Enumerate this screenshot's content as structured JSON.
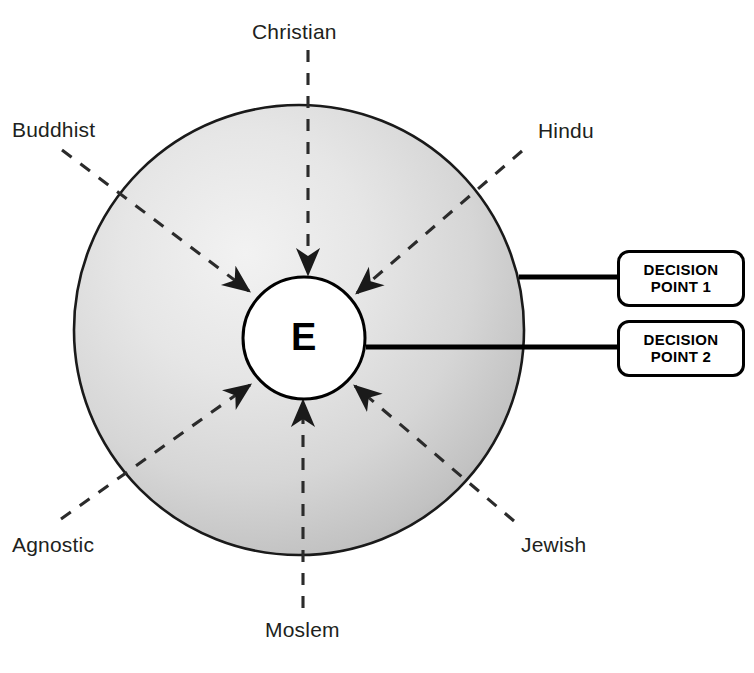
{
  "diagram": {
    "center": {
      "letter": "E",
      "shape": "circle"
    },
    "spokes": [
      {
        "id": "christian",
        "label": "Christian",
        "direction": "top",
        "label_x": 252,
        "label_y": 20,
        "line": {
          "x1": 308,
          "y1": 50,
          "x2": 308,
          "y2": 272
        },
        "arrow_angle": 90
      },
      {
        "id": "hindu",
        "label": "Hindu",
        "direction": "top-right",
        "label_x": 538,
        "label_y": 119,
        "line": {
          "x1": 520,
          "y1": 152,
          "x2": 354,
          "y2": 292
        },
        "arrow_angle": 140
      },
      {
        "id": "jewish",
        "label": "Jewish",
        "direction": "bottom-right",
        "label_x": 521,
        "label_y": 533,
        "line": {
          "x1": 513,
          "y1": 520,
          "x2": 352,
          "y2": 385
        },
        "arrow_angle": 220
      },
      {
        "id": "moslem",
        "label": "Moslem",
        "direction": "bottom",
        "label_x": 265,
        "label_y": 618,
        "line": {
          "x1": 303,
          "y1": 608,
          "x2": 303,
          "y2": 404
        },
        "arrow_angle": 270
      },
      {
        "id": "agnostic",
        "label": "Agnostic",
        "direction": "bottom-left",
        "label_x": 12,
        "label_y": 533,
        "line": {
          "x1": 62,
          "y1": 518,
          "x2": 252,
          "y2": 384
        },
        "arrow_angle": 325
      },
      {
        "id": "buddhist",
        "label": "Buddhist",
        "direction": "top-left",
        "label_x": 12,
        "label_y": 118,
        "line": {
          "x1": 62,
          "y1": 150,
          "x2": 250,
          "y2": 290
        },
        "arrow_angle": 40
      }
    ],
    "decision_points": [
      {
        "id": "decision-point-1",
        "line_1": "DECISION",
        "line_2": "POINT 1",
        "box": {
          "x": 617,
          "y": 250,
          "width": 128,
          "height": 57
        },
        "connector": {
          "x1": 521,
          "y1": 277,
          "x2": 617,
          "y2": 277
        }
      },
      {
        "id": "decision-point-2",
        "line_1": "DECISION",
        "line_2": "POINT 2",
        "box": {
          "x": 617,
          "y": 320,
          "width": 128,
          "height": 57
        },
        "connector": {
          "x1": 366,
          "y1": 347,
          "x2": 617,
          "y2": 347
        }
      }
    ],
    "colors": {
      "stroke": "#1a1a1a",
      "text": "#211f20",
      "sphere_light": "#eeeeee",
      "sphere_mid": "#dedede",
      "sphere_dark": "#b7b7b7",
      "center_fill": "#ffffff",
      "page_background": "#ffffff"
    }
  }
}
